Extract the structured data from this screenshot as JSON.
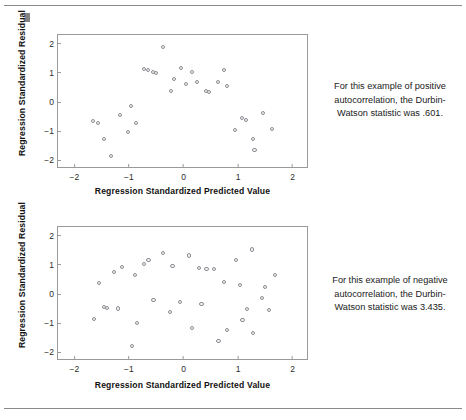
{
  "page": {
    "background": "#ffffff",
    "rule_color": "#8a8a8a"
  },
  "panels": [
    {
      "name": "positive-autocorrelation",
      "caption": "For this example of positive autocorrelation, the Durbin-Watson statistic was .601.",
      "chart_data": {
        "type": "scatter",
        "title": "",
        "xlabel": "Regression Standardized Predicted Value",
        "ylabel": "Regression Standardized Residual",
        "xlim": [
          -2.3,
          2.3
        ],
        "ylim": [
          -2.3,
          2.3
        ],
        "xticks": [
          -2,
          -1,
          0,
          1,
          2
        ],
        "yticks": [
          -2,
          -1,
          0,
          1,
          2
        ],
        "xticklabels": [
          "−2",
          "−1",
          "0",
          "1",
          "2"
        ],
        "yticklabels": [
          "−2",
          "−1",
          "0",
          "1",
          "2"
        ],
        "grid": false,
        "legend": false,
        "marker": {
          "shape": "open-circle",
          "edge_color": "#8d8d93",
          "fill_color": "#f4f4f6",
          "size": 4.2
        },
        "points": [
          {
            "x": -1.66,
            "y": -0.65
          },
          {
            "x": -1.57,
            "y": -0.72
          },
          {
            "x": -1.45,
            "y": -1.28
          },
          {
            "x": -1.33,
            "y": -1.84
          },
          {
            "x": -1.17,
            "y": -0.46
          },
          {
            "x": -1.02,
            "y": -1.02
          },
          {
            "x": -0.96,
            "y": -0.15
          },
          {
            "x": -0.87,
            "y": -0.71
          },
          {
            "x": -0.73,
            "y": 1.13
          },
          {
            "x": -0.65,
            "y": 1.09
          },
          {
            "x": -0.56,
            "y": 1.02
          },
          {
            "x": -0.51,
            "y": 0.99
          },
          {
            "x": -0.38,
            "y": 1.89
          },
          {
            "x": -0.23,
            "y": 0.37
          },
          {
            "x": -0.17,
            "y": 0.78
          },
          {
            "x": -0.05,
            "y": 1.16
          },
          {
            "x": 0.05,
            "y": 0.62
          },
          {
            "x": 0.15,
            "y": 1.02
          },
          {
            "x": 0.24,
            "y": 0.7
          },
          {
            "x": 0.41,
            "y": 0.37
          },
          {
            "x": 0.47,
            "y": 0.33
          },
          {
            "x": 0.63,
            "y": 0.7
          },
          {
            "x": 0.74,
            "y": 1.11
          },
          {
            "x": 0.79,
            "y": 0.55
          },
          {
            "x": 0.95,
            "y": -0.95
          },
          {
            "x": 1.07,
            "y": -0.55
          },
          {
            "x": 1.14,
            "y": -0.61
          },
          {
            "x": 1.28,
            "y": -1.26
          },
          {
            "x": 1.3,
            "y": -1.66
          },
          {
            "x": 1.45,
            "y": -0.37
          },
          {
            "x": 1.62,
            "y": -0.93
          }
        ]
      }
    },
    {
      "name": "negative-autocorrelation",
      "caption": "For this example of negative autocorrelation, the Durbin-Watson statistic was 3.435.",
      "chart_data": {
        "type": "scatter",
        "title": "",
        "xlabel": "Regression Standardized Predicted Value",
        "ylabel": "Regression Standardized Residual",
        "xlim": [
          -2.3,
          2.3
        ],
        "ylim": [
          -2.3,
          2.3
        ],
        "xticks": [
          -2,
          -1,
          0,
          1,
          2
        ],
        "yticks": [
          -2,
          -1,
          0,
          1,
          2
        ],
        "xticklabels": [
          "−2",
          "−1",
          "0",
          "1",
          "2"
        ],
        "yticklabels": [
          "−2",
          "−1",
          "0",
          "1",
          "2"
        ],
        "grid": false,
        "legend": false,
        "marker": {
          "shape": "open-circle",
          "edge_color": "#8d8d93",
          "fill_color": "#f4f4f6",
          "size": 4.2
        },
        "points": [
          {
            "x": -1.64,
            "y": -0.86
          },
          {
            "x": -1.55,
            "y": 0.37
          },
          {
            "x": -1.46,
            "y": -0.45
          },
          {
            "x": -1.4,
            "y": -0.48
          },
          {
            "x": -1.28,
            "y": 0.75
          },
          {
            "x": -1.2,
            "y": -0.5
          },
          {
            "x": -1.13,
            "y": 0.92
          },
          {
            "x": -0.95,
            "y": -1.78
          },
          {
            "x": -0.89,
            "y": 0.65
          },
          {
            "x": -0.85,
            "y": -1.0
          },
          {
            "x": -0.72,
            "y": 1.04
          },
          {
            "x": -0.64,
            "y": 1.17
          },
          {
            "x": -0.55,
            "y": -0.21
          },
          {
            "x": -0.37,
            "y": 1.4
          },
          {
            "x": -0.25,
            "y": -0.63
          },
          {
            "x": -0.2,
            "y": 0.97
          },
          {
            "x": -0.06,
            "y": -0.27
          },
          {
            "x": 0.1,
            "y": 1.32
          },
          {
            "x": 0.16,
            "y": -1.16
          },
          {
            "x": 0.28,
            "y": 0.89
          },
          {
            "x": 0.33,
            "y": -0.34
          },
          {
            "x": 0.42,
            "y": 0.85
          },
          {
            "x": 0.56,
            "y": 0.85
          },
          {
            "x": 0.64,
            "y": -1.62
          },
          {
            "x": 0.74,
            "y": 0.41
          },
          {
            "x": 0.8,
            "y": -1.24
          },
          {
            "x": 0.96,
            "y": 1.17
          },
          {
            "x": 1.03,
            "y": 0.31
          },
          {
            "x": 1.08,
            "y": -0.9
          },
          {
            "x": 1.17,
            "y": -0.52
          },
          {
            "x": 1.25,
            "y": 1.53
          },
          {
            "x": 1.27,
            "y": -1.33
          },
          {
            "x": 1.44,
            "y": -0.13
          },
          {
            "x": 1.5,
            "y": 0.24
          },
          {
            "x": 1.57,
            "y": -0.54
          },
          {
            "x": 1.68,
            "y": 0.66
          }
        ]
      }
    }
  ]
}
